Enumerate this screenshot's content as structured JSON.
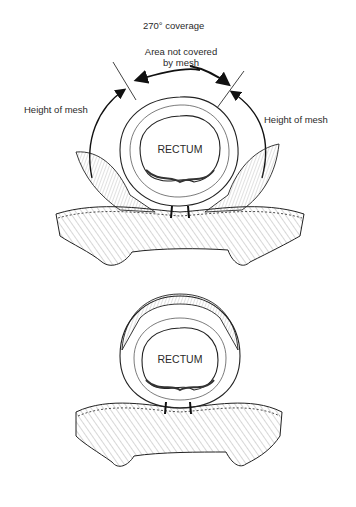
{
  "figure": {
    "top_panel": {
      "title": "270° coverage",
      "area_label_line1": "Area not covered",
      "area_label_line2": "by mesh",
      "left_label": "Height of mesh",
      "right_label": "Height of mesh",
      "organ_label": "RECTUM"
    },
    "bottom_panel": {
      "organ_label": "RECTUM"
    }
  }
}
